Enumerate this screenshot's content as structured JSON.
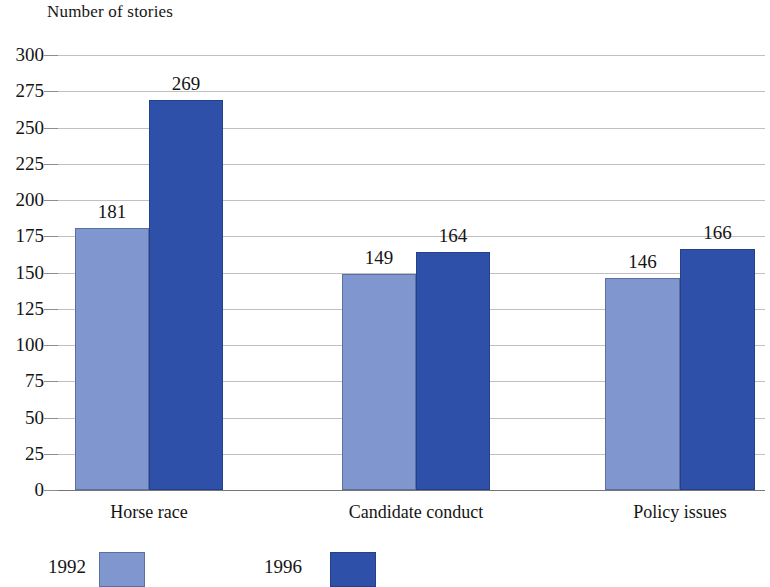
{
  "chart_data": {
    "type": "bar",
    "title": "Number of stories",
    "xlabel": "",
    "ylabel": "",
    "categories": [
      "Horse race",
      "Candidate conduct",
      "Policy issues"
    ],
    "series": [
      {
        "name": "1992",
        "color": "#8096cf",
        "values": [
          181,
          149,
          146
        ]
      },
      {
        "name": "1996",
        "color": "#2f50a8",
        "values": [
          269,
          164,
          166
        ]
      }
    ],
    "ylim": [
      0,
      300
    ],
    "ytick_step": 25,
    "yticks": [
      300,
      275,
      250,
      225,
      200,
      175,
      150,
      125,
      100,
      75,
      50,
      25,
      0
    ],
    "ytick_labels": [
      "300",
      "275",
      "250",
      "225",
      "200",
      "175",
      "150",
      "125",
      "100",
      "75",
      "50",
      "25",
      "0"
    ],
    "data_labels": [
      [
        "181",
        "149",
        "146"
      ],
      [
        "269",
        "164",
        "166"
      ]
    ],
    "grid": true,
    "legend_position": "bottom-left",
    "legend_entries": [
      "1992",
      "1996"
    ]
  }
}
